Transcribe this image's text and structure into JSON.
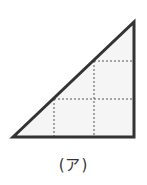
{
  "figure": {
    "label": "(ア)",
    "shape": "right-triangle",
    "grid": {
      "columns": 3,
      "rows": 3,
      "style": "dotted"
    },
    "colors": {
      "fill": "#f5f5f5",
      "outline": "#333333",
      "grid": "#555555"
    }
  }
}
